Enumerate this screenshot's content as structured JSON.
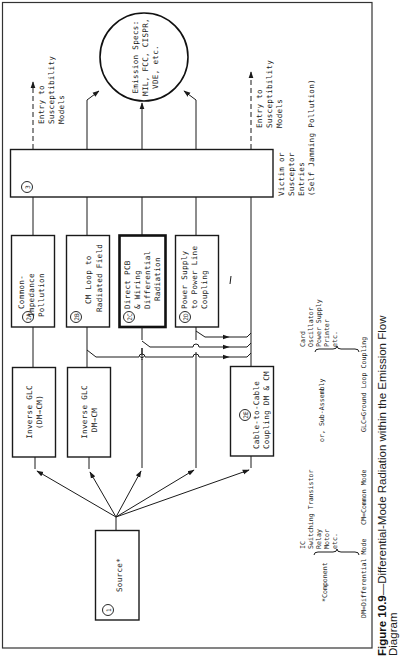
{
  "figure": {
    "caption_label": "Figure 10.9",
    "caption_text": "—Differential-Mode Radiation within the Emission Flow",
    "caption_line2": "Diagram",
    "orientation": "rotated 90° counterclockwise"
  },
  "nodes": {
    "source": {
      "id": "1",
      "label": "Source*"
    },
    "inverse_glc_1": {
      "line1": "Inverse GLC",
      "line2": "(DM→CM)"
    },
    "inverse_glc_2": {
      "line1": "Inverse GLC",
      "line2": "DM→CM"
    },
    "n2a": {
      "id": "2A",
      "line1": "Common-",
      "line2": "Impedance",
      "line3": "Pollution"
    },
    "n2b": {
      "id": "2B",
      "line1": "CM Loop to",
      "line2": "Radiated Field"
    },
    "n2c": {
      "id": "2C",
      "line1": "Direct PCB",
      "line2": "& Wiring",
      "line3": "Differential",
      "line4": "Radiation"
    },
    "n2d": {
      "id": "2D",
      "line1": "Power Supply",
      "line2": "to Power Line",
      "line3": "Coupling"
    },
    "n2e": {
      "id": "2E",
      "line1": "Cable-to-Cable",
      "line2": "Coupling DM & CM"
    },
    "n3": {
      "id": "3",
      "line1": "Victim or",
      "line2": "Susceptor",
      "line3": "Entries",
      "line4": "(Self Jamming Pollution)"
    },
    "emission_specs": {
      "line1": "Emission Specs:",
      "line2": "MIL, FCC, CISPR,",
      "line3": "VDE, etc."
    },
    "entry_left": {
      "line1": "Entry to",
      "line2": "Susceptibility",
      "line3": "Models"
    },
    "entry_right": {
      "line1": "Entry to",
      "line2": "Susceptibility",
      "line3": "Models"
    }
  },
  "legend": {
    "component_label": "*Component",
    "component_items": [
      "IC",
      "Switching Transistor",
      "Relay",
      "Motor",
      "etc."
    ],
    "or_label": "or, Sub-Assembly",
    "subassembly_items": [
      "Card",
      "Oscillator",
      "Power Supply",
      "Printer",
      "etc."
    ],
    "abbrev_dm": "DM=Differential Mode",
    "abbrev_cm": "CM=Common Mode",
    "abbrev_glc": "GLC=Ground Loop Coupling"
  }
}
